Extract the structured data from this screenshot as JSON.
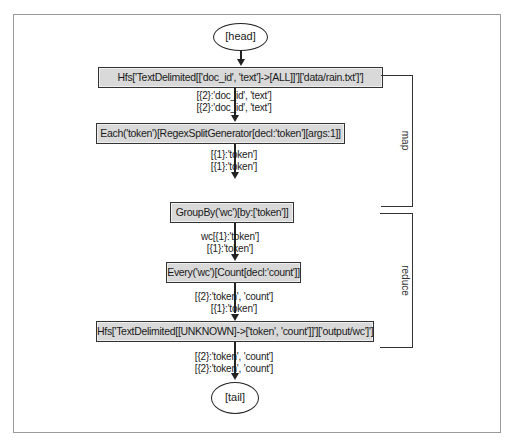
{
  "diagram": {
    "head": "[head]",
    "tail": "[tail]",
    "nodes": [
      "Hfs['TextDelimited[['doc_id', 'text']->[ALL]]']['data/rain.txt']']",
      "Each('token')[RegexSplitGenerator[decl:'token'][args:1]]",
      "GroupBy('wc')[by:['token']]",
      "Every('wc')[Count[decl:'count']]",
      "Hfs['TextDelimited[[UNKNOWN]->['token', 'count']]']['output/wc']']"
    ],
    "edges": [
      [
        "[{2}:'doc_id', 'text']",
        "[{2}:'doc_id', 'text']"
      ],
      [
        "[{1}:'token']",
        "[{1}:'token']"
      ],
      [
        "wc[{1}:'token']",
        "[{1}:'token']"
      ],
      [
        "[{2}:'token', 'count']",
        "[{1}:'token']"
      ],
      [
        "[{2}:'token', 'count']",
        "[{2}:'token', 'count']"
      ]
    ],
    "groups": {
      "map": "map",
      "reduce": "reduce"
    }
  }
}
